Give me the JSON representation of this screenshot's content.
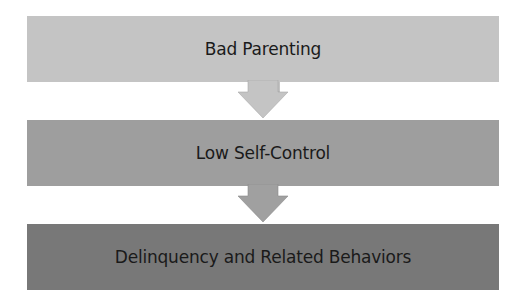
{
  "diagram": {
    "type": "flowchart-vertical",
    "nodes": [
      {
        "id": "bad-parenting",
        "label": "Bad Parenting",
        "color": "#c4c4c4"
      },
      {
        "id": "low-self-control",
        "label": "Low Self-Control",
        "color": "#9e9e9e"
      },
      {
        "id": "delinquency",
        "label": "Delinquency and Related Behaviors",
        "color": "#787878"
      }
    ],
    "edges": [
      {
        "from": "bad-parenting",
        "to": "low-self-control",
        "color": "#c4c4c4"
      },
      {
        "from": "low-self-control",
        "to": "delinquency",
        "color": "#9e9e9e"
      }
    ]
  }
}
